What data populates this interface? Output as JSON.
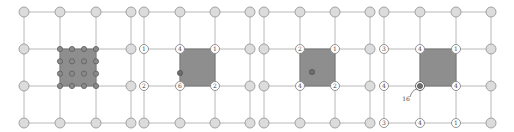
{
  "colors": {
    "grid_line": "#b8b8b8",
    "node_fill": "#dcdcdc",
    "node_stroke": "#9a9a9a",
    "label_node_fill": "#ffffff",
    "label_node_stroke": "#888888",
    "shaded_cell": "#8e8e8e",
    "shaded_border": "#777777",
    "dot_fill": "#6e6e6e",
    "text": "#444444"
  },
  "panels": [
    {
      "id": "panel-1",
      "xs": [
        24,
        60,
        96,
        131
      ],
      "ys": [
        12,
        49,
        86,
        123
      ],
      "shaded_cell": {
        "col": 1,
        "row": 1
      },
      "subdots_grid": 4,
      "labels": [],
      "extra_dots": []
    },
    {
      "id": "panel-2",
      "xs": [
        144,
        180,
        215,
        250
      ],
      "ys": [
        12,
        49,
        86,
        123
      ],
      "shaded_cell": {
        "col": 1,
        "row": 1
      },
      "subdots_grid": 0,
      "labels": [
        {
          "col": 0,
          "row": 1,
          "text": "1"
        },
        {
          "col": 0,
          "row": 2,
          "text": "2"
        },
        {
          "col": 1,
          "row": 1,
          "text": "4"
        },
        {
          "col": 2,
          "row": 1,
          "text": "1"
        },
        {
          "col": 1,
          "row": 2,
          "text": "6"
        },
        {
          "col": 2,
          "row": 2,
          "text": "2"
        }
      ],
      "extra_dots": [
        {
          "x": 180,
          "y": 73
        }
      ]
    },
    {
      "id": "panel-3",
      "xs": [
        264,
        300,
        335,
        370
      ],
      "ys": [
        12,
        49,
        86,
        123
      ],
      "shaded_cell": {
        "col": 1,
        "row": 1
      },
      "subdots_grid": 0,
      "labels": [
        {
          "col": 1,
          "row": 1,
          "text": "2"
        },
        {
          "col": 2,
          "row": 1,
          "text": "1"
        },
        {
          "col": 1,
          "row": 2,
          "text": "4"
        },
        {
          "col": 2,
          "row": 2,
          "text": "2"
        }
      ],
      "extra_dots": [
        {
          "x": 312,
          "y": 72
        }
      ]
    },
    {
      "id": "panel-4",
      "xs": [
        384,
        420,
        456,
        491
      ],
      "ys": [
        12,
        49,
        86,
        123
      ],
      "shaded_cell": {
        "col": 1,
        "row": 1
      },
      "subdots_grid": 0,
      "labels": [
        {
          "col": 0,
          "row": 1,
          "text": "3"
        },
        {
          "col": 0,
          "row": 2,
          "text": "4"
        },
        {
          "col": 0,
          "row": 3,
          "text": "3"
        },
        {
          "col": 1,
          "row": 1,
          "text": "4"
        },
        {
          "col": 2,
          "row": 1,
          "text": "1"
        },
        {
          "col": 2,
          "row": 2,
          "text": "4"
        },
        {
          "col": 1,
          "row": 3,
          "text": "4"
        },
        {
          "col": 2,
          "row": 3,
          "text": "1"
        }
      ],
      "special_node": {
        "col": 1,
        "row": 2
      },
      "annotation": {
        "text": "16",
        "x": 406,
        "y": 101
      },
      "extra_dots": []
    }
  ]
}
